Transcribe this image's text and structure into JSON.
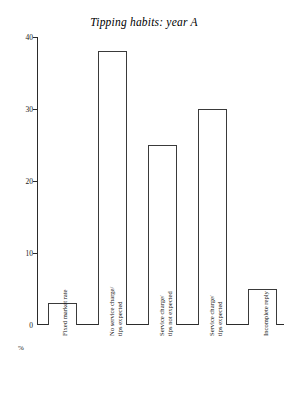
{
  "chart_data": {
    "type": "bar",
    "title": "Tipping habits: year A",
    "xlabel": "",
    "ylabel": "%",
    "ylim": [
      0,
      40
    ],
    "yticks": [
      0,
      10,
      20,
      30,
      40
    ],
    "ytick_labels": [
      "0",
      "10",
      "20",
      "30",
      "40"
    ],
    "grid": false,
    "legend": "none",
    "categories": [
      "Fixed market rate",
      "No service charge/ tips expected",
      "Service charge/ tips not expected",
      "Service charge/ tips expected",
      "Incomplete reply"
    ],
    "category_lines": [
      [
        "Fixed market rate"
      ],
      [
        "No service charge/",
        "tips expected"
      ],
      [
        "Service charge/",
        "tips not expected"
      ],
      [
        "Service charge/",
        "tips expected"
      ],
      [
        "Incomplete reply"
      ]
    ],
    "values": [
      3,
      38,
      25,
      30,
      5
    ]
  },
  "axis": {
    "y_unit_label": "%",
    "zero_label": "0"
  },
  "style": {
    "bar_fill": "#ffffff",
    "bar_stroke": "#3a3a3a",
    "axis_color": "#2b2b2b",
    "text_color": "#111111",
    "background": "#ffffff"
  }
}
